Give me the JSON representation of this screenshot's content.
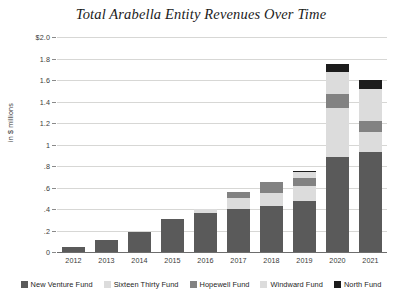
{
  "chart_data": {
    "type": "bar",
    "stacked": true,
    "title": "Total Arabella Entity Revenues Over Time",
    "xlabel": "",
    "ylabel": "in $ millions",
    "ylim": [
      0,
      2.0
    ],
    "ytick_labels": [
      "$2.0",
      "1.8",
      "1.6",
      "1.4",
      "1.2",
      "1",
      ".8",
      ".6",
      ".4",
      ".2",
      "0"
    ],
    "ytick_values": [
      2.0,
      1.8,
      1.6,
      1.4,
      1.2,
      1.0,
      0.8,
      0.6,
      0.4,
      0.2,
      0
    ],
    "grid": true,
    "legend_position": "bottom",
    "categories": [
      "2012",
      "2013",
      "2014",
      "2015",
      "2016",
      "2017",
      "2018",
      "2019",
      "2020",
      "2021"
    ],
    "series": [
      {
        "name": "New Venture Fund",
        "color": "#5a5a5a",
        "values": [
          0.05,
          0.11,
          0.19,
          0.31,
          0.36,
          0.4,
          0.43,
          0.47,
          0.88,
          0.93
        ]
      },
      {
        "name": "Sixteen Thirty Fund",
        "color": "#dcdcdc",
        "values": [
          0.0,
          0.0,
          0.0,
          0.0,
          0.04,
          0.1,
          0.12,
          0.14,
          0.46,
          0.19
        ]
      },
      {
        "name": "Hopewell Fund",
        "color": "#828282",
        "values": [
          0.0,
          0.0,
          0.0,
          0.0,
          0.0,
          0.06,
          0.1,
          0.08,
          0.13,
          0.1
        ]
      },
      {
        "name": "Windward Fund",
        "color": "#dcdcdc",
        "values": [
          0.0,
          0.0,
          0.0,
          0.0,
          0.0,
          0.0,
          0.0,
          0.05,
          0.2,
          0.3
        ]
      },
      {
        "name": "North Fund",
        "color": "#1c1c1c",
        "values": [
          0.0,
          0.0,
          0.0,
          0.0,
          0.0,
          0.0,
          0.0,
          0.01,
          0.08,
          0.08
        ]
      }
    ]
  }
}
